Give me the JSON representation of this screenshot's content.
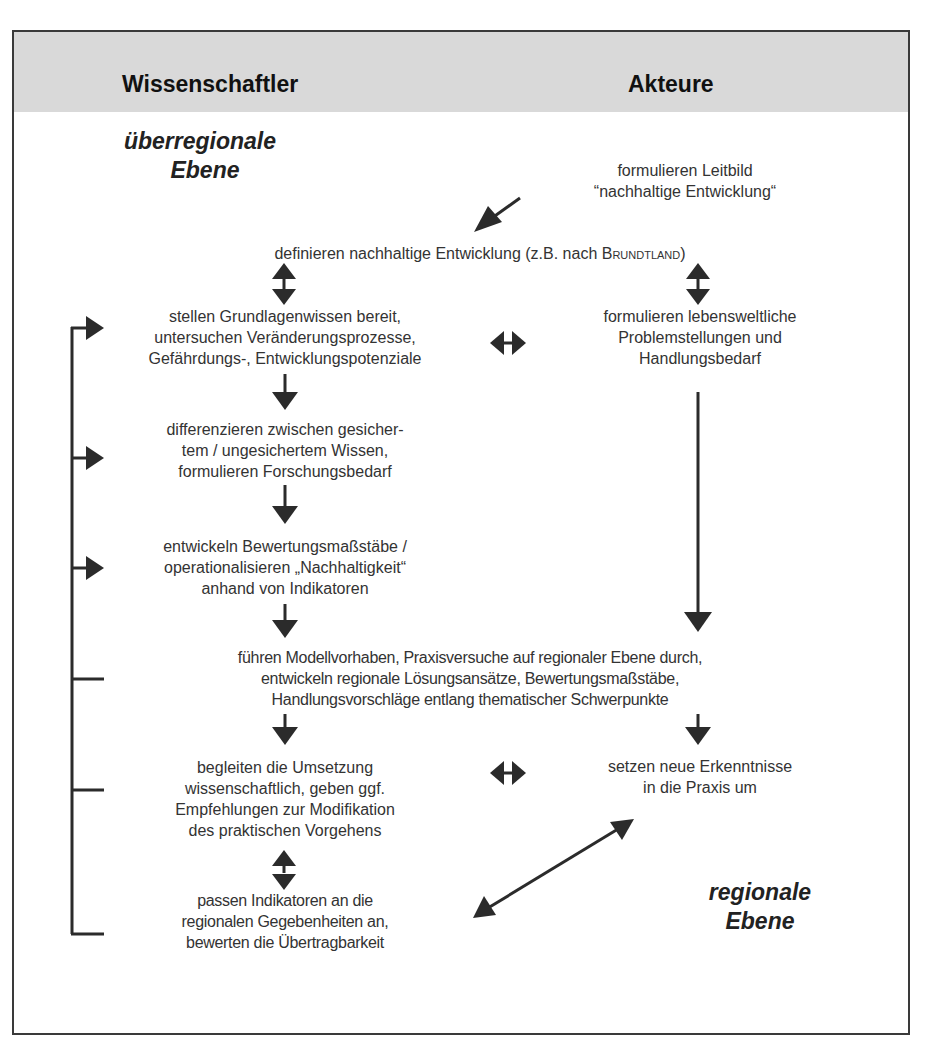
{
  "header": {
    "left_title": "Wissenschaftler",
    "right_title": "Akteure"
  },
  "levels": {
    "top": [
      "überregionale",
      "Ebene"
    ],
    "bottom": [
      "regionale",
      "Ebene"
    ]
  },
  "nodes": {
    "leitbild": [
      "formulieren Leitbild",
      "“nachhaltige Entwicklung“"
    ],
    "definieren": {
      "prefix": "definieren nachhaltige Entwicklung (z.B. nach ",
      "name": "Brundtland",
      "suffix": ")"
    },
    "grundlagen": [
      "stellen Grundlagenwissen bereit,",
      "untersuchen Veränderungsprozesse,",
      "Gefährdungs-, Entwicklungspotenziale"
    ],
    "lebensweltlich": [
      "formulieren lebensweltliche",
      "Problemstellungen und",
      "Handlungsbedarf"
    ],
    "differenzieren": [
      "differenzieren zwischen gesicher-",
      "tem / ungesichertem Wissen,",
      "formulieren Forschungsbedarf"
    ],
    "bewertung": [
      "entwickeln Bewertungsmaßstäbe /",
      "operationalisieren „Nachhaltigkeit“",
      "anhand von Indikatoren"
    ],
    "modellvorhaben": [
      "führen Modellvorhaben, Praxisversuche auf regionaler Ebene durch,",
      "entwickeln regionale Lösungsansätze,  Bewertungsmaßstäbe,",
      "Handlungsvorschläge entlang thematischer Schwerpunkte"
    ],
    "begleiten": [
      "begleiten die Umsetzung",
      "wissenschaftlich, geben ggf.",
      "Empfehlungen zur Modifikation",
      "des praktischen Vorgehens"
    ],
    "praxis": [
      "setzen neue Erkenntnisse",
      "in die Praxis um"
    ],
    "indikatoren": [
      "passen Indikatoren an die",
      "regionalen Gegebenheiten an,",
      "bewerten die Übertragbarkeit"
    ]
  },
  "colors": {
    "header_band": "#d9d9d9",
    "frame": "#3a3a3a",
    "arrow": "#2b2b2b",
    "text": "#333333"
  }
}
